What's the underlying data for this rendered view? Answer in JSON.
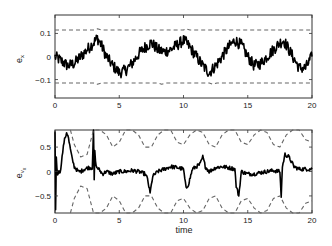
{
  "chart_data": [
    {
      "type": "line",
      "title": "",
      "xlabel": "",
      "ylabel": "e_x",
      "xlim": [
        0,
        20
      ],
      "ylim": [
        -0.18,
        0.18
      ],
      "xticks": [
        0,
        5,
        10,
        15,
        20
      ],
      "xtick_labels": [
        "0",
        "5",
        "10",
        "15",
        "20"
      ],
      "yticks": [
        0.1,
        0,
        -0.1
      ],
      "ytick_labels": [
        "0.1",
        "0",
        "−0.1"
      ],
      "grid": false,
      "legend": null,
      "series": [
        {
          "name": "error",
          "style": "solid",
          "color": "#000000",
          "x": [
            0,
            0.5,
            1,
            1.5,
            2,
            2.5,
            3,
            3.3,
            3.6,
            4,
            4.5,
            5,
            5.5,
            6,
            6.5,
            7,
            7.5,
            8,
            8.5,
            9,
            9.5,
            10,
            10.2,
            10.5,
            11,
            11.5,
            12,
            12.5,
            13,
            13.5,
            14,
            14.5,
            15,
            15.5,
            16,
            16.5,
            17,
            17.5,
            17.8,
            18,
            18.5,
            19,
            19.5,
            20
          ],
          "y": [
            0.0,
            -0.02,
            -0.04,
            -0.03,
            0.0,
            0.03,
            0.06,
            0.08,
            0.05,
            0.0,
            -0.04,
            -0.07,
            -0.06,
            -0.03,
            0.01,
            0.04,
            0.06,
            0.03,
            0.02,
            0.03,
            0.05,
            0.07,
            0.06,
            0.04,
            0.0,
            -0.04,
            -0.07,
            -0.04,
            0.0,
            0.04,
            0.07,
            0.05,
            0.0,
            -0.04,
            -0.03,
            0.0,
            0.03,
            0.06,
            0.07,
            0.05,
            0.0,
            -0.05,
            -0.05,
            0.0
          ],
          "noise_amplitude": 0.025
        },
        {
          "name": "upper bound",
          "style": "dashed",
          "color": "#666666",
          "x": [
            0,
            3,
            3.3,
            3.6,
            5,
            10,
            10.2,
            10.5,
            15,
            20
          ],
          "y": [
            0.115,
            0.115,
            0.12,
            0.115,
            0.115,
            0.115,
            0.12,
            0.115,
            0.115,
            0.115
          ]
        },
        {
          "name": "lower bound",
          "style": "dashed",
          "color": "#666666",
          "x": [
            0,
            3,
            3.3,
            3.6,
            5,
            8,
            8.3,
            8.6,
            12,
            12.3,
            12.6,
            20
          ],
          "y": [
            -0.115,
            -0.115,
            -0.12,
            -0.115,
            -0.115,
            -0.115,
            -0.12,
            -0.115,
            -0.115,
            -0.12,
            -0.115,
            -0.115
          ]
        }
      ]
    },
    {
      "type": "line",
      "title": "",
      "xlabel": "time",
      "ylabel": "e_{v_x}",
      "xlim": [
        0,
        20
      ],
      "ylim": [
        -0.85,
        0.85
      ],
      "xticks": [
        0,
        5,
        10,
        15,
        20
      ],
      "xtick_labels": [
        "0",
        "5",
        "10",
        "15",
        "20"
      ],
      "yticks": [
        0.5,
        0,
        -0.5
      ],
      "ytick_labels": [
        "0.5",
        "0",
        "−0.5"
      ],
      "grid": false,
      "legend": null,
      "series": [
        {
          "name": "error",
          "style": "solid",
          "color": "#000000",
          "x": [
            0,
            0.05,
            0.1,
            0.2,
            0.3,
            0.4,
            0.5,
            0.7,
            0.9,
            1.0,
            1.1,
            1.3,
            1.5,
            1.8,
            2.0,
            2.3,
            2.6,
            2.9,
            3.0,
            3.05,
            3.1,
            3.2,
            3.4,
            3.7,
            4.0,
            4.5,
            5.0,
            5.5,
            6.0,
            6.5,
            7.0,
            7.2,
            7.4,
            7.6,
            8.0,
            8.5,
            9.0,
            9.5,
            10.0,
            10.2,
            10.4,
            10.7,
            11.0,
            11.3,
            11.5,
            11.7,
            12.0,
            12.5,
            13.0,
            13.5,
            14.0,
            14.1,
            14.3,
            14.5,
            15.0,
            15.5,
            16.0,
            16.5,
            17.0,
            17.5,
            17.6,
            17.7,
            17.9,
            18.2,
            18.6,
            19.0,
            19.5,
            20.0
          ],
          "y": [
            0.85,
            -0.8,
            0.3,
            -0.1,
            0.05,
            -0.05,
            0.2,
            0.6,
            0.8,
            0.75,
            0.6,
            0.3,
            0.1,
            0.0,
            0.0,
            0.05,
            0.08,
            0.08,
            0.85,
            -0.2,
            0.4,
            0.1,
            0.05,
            -0.05,
            0.0,
            -0.05,
            0.0,
            0.0,
            0.02,
            0.0,
            -0.05,
            -0.15,
            -0.45,
            -0.1,
            0.0,
            0.05,
            0.1,
            0.08,
            0.05,
            -0.35,
            -0.25,
            0.05,
            0.1,
            0.15,
            0.3,
            0.1,
            0.0,
            0.08,
            0.1,
            0.08,
            0.05,
            -0.3,
            -0.5,
            0.0,
            -0.05,
            -0.05,
            -0.02,
            0.0,
            0.02,
            0.0,
            -0.5,
            0.1,
            0.35,
            0.3,
            0.1,
            0.05,
            0.05,
            0.05
          ],
          "noise_amplitude": 0.04
        },
        {
          "name": "upper bound",
          "style": "dashed",
          "color": "#666666",
          "x": [
            1.2,
            1.5,
            2.0,
            2.5,
            3.0,
            3.5,
            4.0,
            4.5,
            5.0,
            5.5,
            6.0,
            6.5,
            7.0,
            7.5,
            8.0,
            8.5,
            9.0,
            9.5,
            10.0,
            10.5,
            11.0,
            11.5,
            12.0,
            12.5,
            13.0,
            13.5,
            14.0,
            14.5,
            15.0,
            15.5,
            16.0,
            16.5,
            17.0,
            17.5,
            18.0,
            18.5,
            19.0,
            19.5,
            20.0
          ],
          "y": [
            0.9,
            0.55,
            0.3,
            0.35,
            0.85,
            0.9,
            0.75,
            0.5,
            0.6,
            0.85,
            0.95,
            0.75,
            0.5,
            0.5,
            0.75,
            0.95,
            0.85,
            0.6,
            0.55,
            0.75,
            0.95,
            0.8,
            0.55,
            0.5,
            0.75,
            0.95,
            0.85,
            0.6,
            0.55,
            0.75,
            0.95,
            0.8,
            0.55,
            0.5,
            0.75,
            0.95,
            0.85,
            0.65,
            0.6
          ]
        },
        {
          "name": "lower bound",
          "style": "dashed",
          "color": "#666666",
          "x": [
            1.2,
            1.5,
            2.0,
            2.5,
            3.0,
            3.5,
            4.0,
            4.5,
            5.0,
            5.5,
            6.0,
            6.5,
            7.0,
            7.5,
            8.0,
            8.5,
            9.0,
            9.5,
            10.0,
            10.5,
            11.0,
            11.5,
            12.0,
            12.5,
            13.0,
            13.5,
            14.0,
            14.5,
            15.0,
            15.5,
            16.0,
            16.5,
            17.0,
            17.5,
            18.0,
            18.5,
            19.0,
            19.5,
            20.0
          ],
          "y": [
            -0.9,
            -0.55,
            -0.3,
            -0.35,
            -0.85,
            -0.9,
            -0.75,
            -0.5,
            -0.6,
            -0.85,
            -0.95,
            -0.75,
            -0.5,
            -0.5,
            -0.75,
            -0.95,
            -0.85,
            -0.6,
            -0.55,
            -0.75,
            -0.95,
            -0.8,
            -0.55,
            -0.5,
            -0.75,
            -0.95,
            -0.85,
            -0.6,
            -0.55,
            -0.75,
            -0.95,
            -0.8,
            -0.55,
            -0.5,
            -0.75,
            -0.95,
            -0.85,
            -0.65,
            -0.6
          ]
        }
      ]
    }
  ],
  "plots": {
    "top": {
      "ylabel_main": "e",
      "ylabel_sub": "x"
    },
    "bottom": {
      "ylabel_main": "e",
      "ylabel_sub": "v",
      "ylabel_subsub": "x",
      "xlabel": "time"
    }
  }
}
